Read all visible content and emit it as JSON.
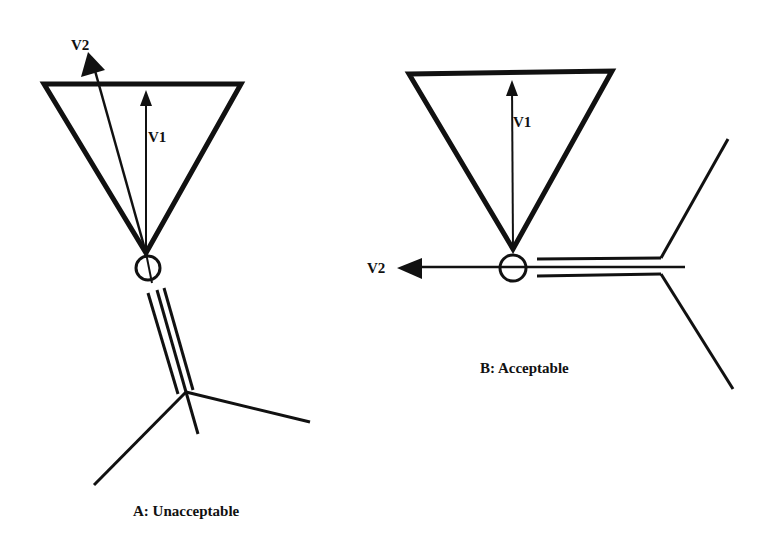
{
  "diagram": {
    "colors": {
      "ink": "#111111",
      "background": "#ffffff"
    },
    "panels": [
      {
        "id": "A",
        "caption": "A: Unacceptable",
        "vectors": {
          "v1": "V1",
          "v2": "V2"
        },
        "description": "Cone (inverted triangle) with V1 along axis; V2 tilted, collinear with a triple-bond group pointing into the cone"
      },
      {
        "id": "B",
        "caption": "B: Acceptable",
        "vectors": {
          "v1": "V1",
          "v2": "V2"
        },
        "description": "Cone (inverted triangle) with V1 along axis; V2 horizontal, perpendicular to V1, along the triple-bond group"
      }
    ]
  }
}
